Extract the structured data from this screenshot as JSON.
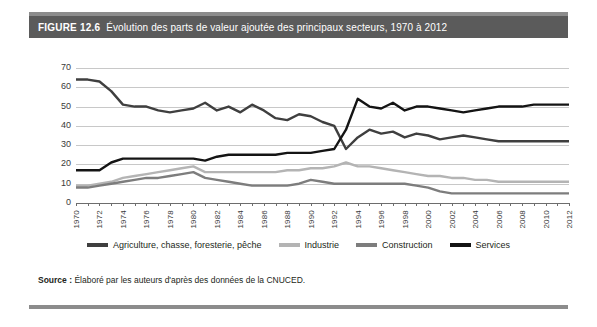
{
  "figure": {
    "number": "FIGURE 12.6",
    "title": "Évolution des parts de valeur ajoutée des principaux secteurs, 1970 à 2012",
    "source_label": "Source :",
    "source_text": "Élaboré par les auteurs d'après des données de la CNUCED."
  },
  "colors": {
    "header_bar": "#5b5b5b",
    "rule": "#8c8c8c",
    "grid": "#c8c8c8",
    "axis": "#6d6d6d",
    "agriculture": "#3f3f3f",
    "industrie": "#b4b4b4",
    "construction": "#7d7d7d",
    "services": "#141414",
    "background": "#ffffff",
    "title_text": "#ffffff"
  },
  "chart_data": {
    "type": "line",
    "title": "Évolution des parts de valeur ajoutée des principaux secteurs, 1970 à 2012",
    "xlabel": "",
    "ylabel": "",
    "xlim": [
      1970,
      2012
    ],
    "ylim": [
      0,
      70
    ],
    "yticks": [
      0,
      10,
      20,
      30,
      40,
      50,
      60,
      70
    ],
    "grid": true,
    "legend_position": "bottom",
    "x": [
      1970,
      1971,
      1972,
      1973,
      1974,
      1975,
      1976,
      1977,
      1978,
      1979,
      1980,
      1981,
      1982,
      1983,
      1984,
      1985,
      1986,
      1987,
      1988,
      1989,
      1990,
      1991,
      1992,
      1993,
      1994,
      1995,
      1996,
      1997,
      1998,
      1999,
      2000,
      2001,
      2002,
      2003,
      2004,
      2005,
      2006,
      2007,
      2008,
      2009,
      2010,
      2011,
      2012
    ],
    "xtick_labels": [
      "1970",
      "1972",
      "1974",
      "1976",
      "1978",
      "1980",
      "1982",
      "1984",
      "1986",
      "1988",
      "1990",
      "1992",
      "1994",
      "1996",
      "1998",
      "2000",
      "2002",
      "2004",
      "2006",
      "2008",
      "2010",
      "2012"
    ],
    "series": [
      {
        "name": "Agriculture, chasse, foresterie, pêche",
        "color": "#3f3f3f",
        "values": [
          64,
          64,
          63,
          58,
          51,
          50,
          50,
          48,
          47,
          48,
          49,
          52,
          48,
          50,
          47,
          51,
          48,
          44,
          43,
          46,
          45,
          42,
          40,
          28,
          34,
          38,
          36,
          37,
          34,
          36,
          35,
          33,
          34,
          35,
          34,
          33,
          32,
          32,
          32,
          32,
          32,
          32,
          32
        ]
      },
      {
        "name": "Industrie",
        "color": "#b4b4b4",
        "values": [
          9,
          9,
          10,
          11,
          13,
          14,
          15,
          16,
          17,
          18,
          19,
          16,
          16,
          16,
          16,
          16,
          16,
          16,
          17,
          17,
          18,
          18,
          19,
          21,
          19,
          19,
          18,
          17,
          16,
          15,
          14,
          14,
          13,
          13,
          12,
          12,
          11,
          11,
          11,
          11,
          11,
          11,
          11
        ]
      },
      {
        "name": "Construction",
        "color": "#7d7d7d",
        "values": [
          8,
          8,
          9,
          10,
          11,
          12,
          13,
          13,
          14,
          15,
          16,
          13,
          12,
          11,
          10,
          9,
          9,
          9,
          9,
          10,
          12,
          11,
          10,
          10,
          10,
          10,
          10,
          10,
          10,
          9,
          8,
          6,
          5,
          5,
          5,
          5,
          5,
          5,
          5,
          5,
          5,
          5,
          5
        ]
      },
      {
        "name": "Services",
        "color": "#141414",
        "values": [
          17,
          17,
          17,
          21,
          23,
          23,
          23,
          23,
          23,
          23,
          23,
          22,
          24,
          25,
          25,
          25,
          25,
          25,
          26,
          26,
          26,
          27,
          28,
          38,
          54,
          50,
          49,
          52,
          48,
          50,
          50,
          49,
          48,
          47,
          48,
          49,
          50,
          50,
          50,
          51,
          51,
          51,
          51
        ]
      }
    ]
  },
  "legend": {
    "items": [
      {
        "label": "Agriculture, chasse, foresterie, pêche",
        "color": "#3f3f3f"
      },
      {
        "label": "Industrie",
        "color": "#b4b4b4"
      },
      {
        "label": "Construction",
        "color": "#7d7d7d"
      },
      {
        "label": "Services",
        "color": "#141414"
      }
    ]
  }
}
